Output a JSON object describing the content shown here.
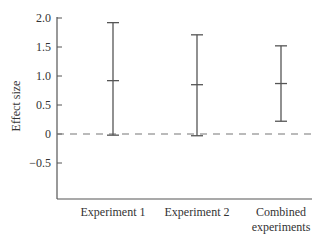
{
  "chart_data": {
    "type": "errorbar",
    "title": "",
    "xlabel": "",
    "ylabel": "Effect size",
    "ylim": [
      -1.0,
      2.0
    ],
    "yticks": [
      "2.0",
      "1.5",
      "1.0",
      "0.5",
      "0",
      "-0.5"
    ],
    "ytick_values": [
      2.0,
      1.5,
      1.0,
      0.5,
      0,
      -0.5
    ],
    "categories": [
      "Experiment 1",
      "Experiment 2",
      "Combined experiments"
    ],
    "category_lines": [
      [
        "Experiment 1"
      ],
      [
        "Experiment 2"
      ],
      [
        "Combined",
        "experiments"
      ]
    ],
    "series": [
      {
        "name": "Effect size",
        "estimate": [
          0.92,
          0.85,
          0.87
        ],
        "lower": [
          -0.02,
          -0.03,
          0.22
        ],
        "upper": [
          1.92,
          1.71,
          1.52
        ]
      }
    ],
    "reference_line": {
      "y": 0,
      "style": "dashed"
    },
    "grid": false,
    "legend": null
  }
}
